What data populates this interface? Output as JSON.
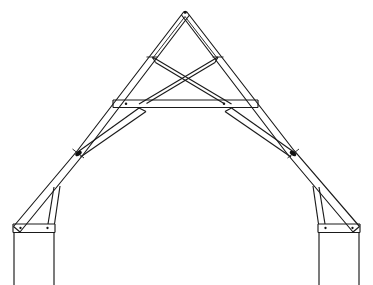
{
  "figure": {
    "title": "Timber cruck-frame roof truss elevation",
    "view": "front elevation",
    "background_color": "#ffffff",
    "line_color": "#1a1a1a",
    "canvas": {
      "width": 373,
      "height": 285
    }
  },
  "members": {
    "apex_label": "apex",
    "collar_label": "collar beam",
    "scissor_label": "scissor brace",
    "blade_label": "cruck blade",
    "wall_plate_label": "wall plate",
    "post_label": "wall post",
    "knee_label": "knee joint",
    "foot_brace_label": "foot brace"
  },
  "geometry": {
    "apex": {
      "x": 185,
      "y": 11
    },
    "knee_left": {
      "x": 77,
      "y": 151
    },
    "knee_right": {
      "x": 294,
      "y": 151
    },
    "plate_left": {
      "x": 13,
      "y": 226
    },
    "plate_right": {
      "x": 360,
      "y": 226
    },
    "collar_y": 104,
    "collar_left_x": 113,
    "collar_right_x": 258,
    "scissor_top_left": {
      "x": 152,
      "y": 57
    },
    "scissor_top_right": {
      "x": 218,
      "y": 57
    },
    "scissor_cross": {
      "x": 185,
      "y": 81
    },
    "baseline_y": 285,
    "member_thickness": 6.5
  },
  "outer_profile": {
    "description": "double-line timbers drawn with parallel edges showing depth",
    "left_blade_outer": "13,226 -> 77,151 -> 185,11",
    "right_blade_outer": "360,226 -> 294,151 -> 185,11"
  },
  "pegs": [
    {
      "name": "collar-peg-left",
      "x": 126,
      "y": 104
    },
    {
      "name": "collar-peg-right",
      "x": 224,
      "y": 104
    },
    {
      "name": "plate-peg-left-inner",
      "x": 47,
      "y": 227
    },
    {
      "name": "plate-peg-left-outer",
      "x": 20,
      "y": 227
    },
    {
      "name": "plate-peg-right-inner",
      "x": 326,
      "y": 227
    },
    {
      "name": "plate-peg-right-outer",
      "x": 353,
      "y": 227
    }
  ],
  "counts": {
    "blades": 2,
    "scissor_braces": 2,
    "collars": 1,
    "posts": 2,
    "wall_plates": 2
  }
}
